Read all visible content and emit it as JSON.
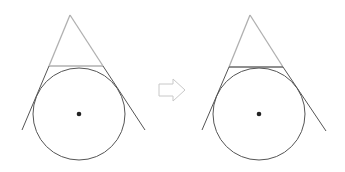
{
  "diagram": {
    "colors": {
      "dark_stroke": "#555555",
      "light_stroke": "#b0b0b0",
      "mid_stroke": "#7a7a7a",
      "dot": "#222222",
      "arrow_stroke": "#c8c8c8"
    },
    "left_figure": {
      "apex": [
        70,
        15
      ],
      "base_y": 66,
      "base_x": [
        49,
        103
      ],
      "circle_center": [
        79,
        114
      ],
      "circle_radius": 46,
      "line_left_end": [
        22,
        130
      ],
      "line_right_end": [
        145,
        130
      ],
      "base_style": "light"
    },
    "arrow": {
      "direction": "right",
      "x": 158,
      "y": 80,
      "width": 28,
      "height": 20
    },
    "right_figure": {
      "apex": [
        250,
        15
      ],
      "base_y": 67,
      "base_x": [
        229,
        283
      ],
      "circle_center": [
        259,
        114
      ],
      "circle_radius": 46,
      "line_left_end": [
        202,
        130
      ],
      "line_right_end": [
        326,
        131
      ],
      "base_style": "dark"
    }
  }
}
